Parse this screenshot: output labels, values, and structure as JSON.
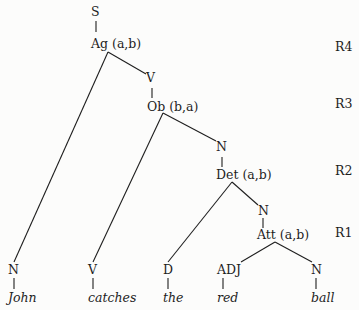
{
  "nodes": {
    "s": "S",
    "ag": "Ag (a,b)",
    "v_top": "V",
    "ob": "Ob (b,a)",
    "n1": "N",
    "det": "Det (a,b)",
    "n2": "N",
    "att": "Att (a,b)",
    "leaf_n": "N",
    "leaf_v": "V",
    "leaf_d": "D",
    "leaf_adj": "ADJ",
    "leaf_n2": "N"
  },
  "words": [
    "John",
    "catches",
    "the",
    "red",
    "ball"
  ],
  "rules": [
    "R4",
    "R3",
    "R2",
    "R1"
  ]
}
